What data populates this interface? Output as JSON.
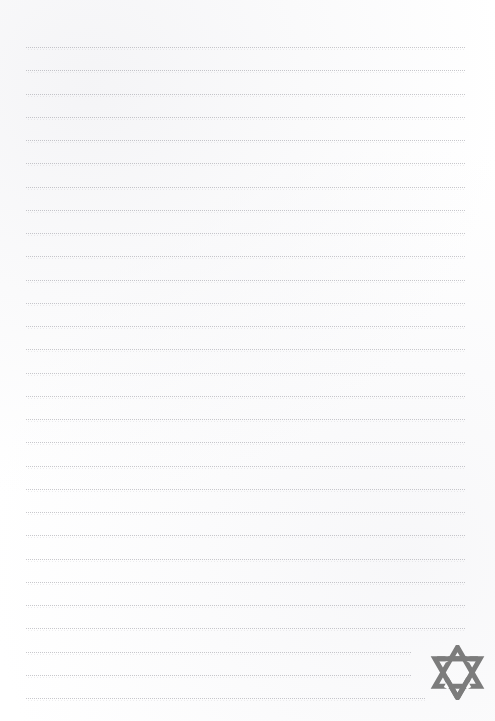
{
  "page": {
    "background_color": "#ffffff",
    "width": 495,
    "height": 721,
    "content_text": "",
    "is_blank": true
  },
  "ruling": {
    "type": "dotted-horizontal-rule",
    "line_color": "#787884",
    "line_count": 28,
    "first_line_y": 47,
    "line_spacing": 23.3,
    "left_margin_x": 26,
    "right_margin_x": 466,
    "lines": [
      {
        "y": 47,
        "x_start": 26,
        "x_end": 466
      },
      {
        "y": 70,
        "x_start": 26,
        "x_end": 466
      },
      {
        "y": 94,
        "x_start": 26,
        "x_end": 466
      },
      {
        "y": 117,
        "x_start": 26,
        "x_end": 466
      },
      {
        "y": 140,
        "x_start": 26,
        "x_end": 466
      },
      {
        "y": 163,
        "x_start": 26,
        "x_end": 466
      },
      {
        "y": 187,
        "x_start": 26,
        "x_end": 466
      },
      {
        "y": 210,
        "x_start": 26,
        "x_end": 466
      },
      {
        "y": 233,
        "x_start": 26,
        "x_end": 466
      },
      {
        "y": 256,
        "x_start": 26,
        "x_end": 466
      },
      {
        "y": 280,
        "x_start": 26,
        "x_end": 466
      },
      {
        "y": 303,
        "x_start": 26,
        "x_end": 466
      },
      {
        "y": 326,
        "x_start": 26,
        "x_end": 466
      },
      {
        "y": 349,
        "x_start": 26,
        "x_end": 466
      },
      {
        "y": 373,
        "x_start": 26,
        "x_end": 466
      },
      {
        "y": 396,
        "x_start": 26,
        "x_end": 466
      },
      {
        "y": 419,
        "x_start": 26,
        "x_end": 466
      },
      {
        "y": 442,
        "x_start": 26,
        "x_end": 466
      },
      {
        "y": 466,
        "x_start": 26,
        "x_end": 466
      },
      {
        "y": 489,
        "x_start": 26,
        "x_end": 466
      },
      {
        "y": 512,
        "x_start": 26,
        "x_end": 466
      },
      {
        "y": 535,
        "x_start": 26,
        "x_end": 466
      },
      {
        "y": 559,
        "x_start": 26,
        "x_end": 466
      },
      {
        "y": 582,
        "x_start": 26,
        "x_end": 466
      },
      {
        "y": 605,
        "x_start": 26,
        "x_end": 466
      },
      {
        "y": 628,
        "x_start": 26,
        "x_end": 466
      },
      {
        "y": 652,
        "x_start": 26,
        "x_end": 412
      },
      {
        "y": 675,
        "x_start": 26,
        "x_end": 412
      },
      {
        "y": 698,
        "x_start": 26,
        "x_end": 425
      }
    ]
  },
  "ornament": {
    "name": "star-of-david",
    "description": "Interwoven hexagram formed by two overlapping outlined triangles",
    "color": "#7c7c7c",
    "x": 430,
    "y": 645,
    "width": 55,
    "height": 55,
    "stroke_width": 5
  }
}
